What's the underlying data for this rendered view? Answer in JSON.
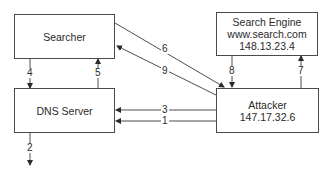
{
  "nodes": {
    "searcher": {
      "label": "Searcher"
    },
    "dns_server": {
      "label": "DNS Server"
    },
    "search_engine": {
      "name": "Search Engine",
      "host": "www.search.com",
      "ip": "148.13.23.4"
    },
    "attacker": {
      "name": "Attacker",
      "ip": "147.17.32.6"
    }
  },
  "edges": [
    {
      "id": "1",
      "label": "1",
      "from": "attacker",
      "to": "dns_server"
    },
    {
      "id": "2",
      "label": "2",
      "from": "dns_server",
      "to": "outside"
    },
    {
      "id": "3",
      "label": "3",
      "from": "attacker",
      "to": "dns_server"
    },
    {
      "id": "4",
      "label": "4",
      "from": "searcher",
      "to": "dns_server"
    },
    {
      "id": "5",
      "label": "5",
      "from": "dns_server",
      "to": "searcher"
    },
    {
      "id": "6",
      "label": "6",
      "from": "searcher",
      "to": "attacker"
    },
    {
      "id": "7",
      "label": "7",
      "from": "attacker",
      "to": "search_engine"
    },
    {
      "id": "8",
      "label": "8",
      "from": "search_engine",
      "to": "attacker"
    },
    {
      "id": "9",
      "label": "9",
      "from": "attacker",
      "to": "searcher"
    }
  ],
  "colors": {
    "line": "#3a3a3a",
    "text": "#2a2a2a",
    "background": "#ffffff"
  }
}
